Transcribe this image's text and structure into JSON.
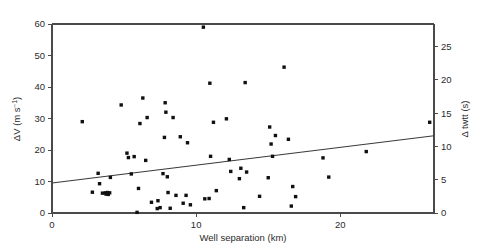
{
  "chart_data": {
    "type": "scatter",
    "title": "",
    "xlabel": "Well separation (km)",
    "ylabel": "ΔV (m s⁻¹)",
    "ylabel_base": "ΔV (m s",
    "ylabel_exponent": "−1",
    "ylabel_close": ")",
    "y2label": "Δ twtt (s)",
    "xlim": [
      0,
      26.5
    ],
    "ylim": [
      0,
      60
    ],
    "y2lim": [
      0,
      28.4
    ],
    "grid": false,
    "legend": null,
    "xticks": [
      0,
      10,
      20
    ],
    "xtick_labels": [
      "0",
      "10",
      "20"
    ],
    "yticks": [
      0,
      10,
      20,
      30,
      40,
      50,
      60
    ],
    "ytick_labels": [
      "0",
      "10",
      "20",
      "30",
      "40",
      "50",
      "60"
    ],
    "y2ticks": [
      0,
      5,
      10,
      15,
      20,
      25
    ],
    "y2tick_labels": [
      "0",
      "5",
      "10",
      "15",
      "20",
      "25"
    ],
    "marker": "square",
    "marker_color": "#101010",
    "marker_size": 3.4,
    "line_color": "#3a3a3a",
    "trend_line": {
      "x0": 0,
      "y0": 9.5,
      "x1": 26.5,
      "y1": 24.5,
      "label": "linear trend"
    },
    "points": [
      [
        2.1,
        29.0
      ],
      [
        2.8,
        6.6
      ],
      [
        3.2,
        12.6
      ],
      [
        3.3,
        9.3
      ],
      [
        3.5,
        6.3
      ],
      [
        3.7,
        6.4
      ],
      [
        3.75,
        6.0
      ],
      [
        3.85,
        6.5
      ],
      [
        3.9,
        5.9
      ],
      [
        4.0,
        6.4
      ],
      [
        4.05,
        11.3
      ],
      [
        4.8,
        34.3
      ],
      [
        5.2,
        19.0
      ],
      [
        5.3,
        17.6
      ],
      [
        5.5,
        12.4
      ],
      [
        5.7,
        17.9
      ],
      [
        5.9,
        0.2
      ],
      [
        6.0,
        7.8
      ],
      [
        6.1,
        28.4
      ],
      [
        6.3,
        36.5
      ],
      [
        6.5,
        16.7
      ],
      [
        6.6,
        30.3
      ],
      [
        6.9,
        3.4
      ],
      [
        7.3,
        1.4
      ],
      [
        7.35,
        3.9
      ],
      [
        7.5,
        1.7
      ],
      [
        7.7,
        12.5
      ],
      [
        7.8,
        24.0
      ],
      [
        7.85,
        35.0
      ],
      [
        7.9,
        32.0
      ],
      [
        8.0,
        11.5
      ],
      [
        8.05,
        6.5
      ],
      [
        8.2,
        1.5
      ],
      [
        8.4,
        30.3
      ],
      [
        8.6,
        5.6
      ],
      [
        8.9,
        24.2
      ],
      [
        9.1,
        3.1
      ],
      [
        9.3,
        5.6
      ],
      [
        9.4,
        22.3
      ],
      [
        9.6,
        2.6
      ],
      [
        10.5,
        59.0
      ],
      [
        10.6,
        4.5
      ],
      [
        10.9,
        4.6
      ],
      [
        10.95,
        41.2
      ],
      [
        11.0,
        18.0
      ],
      [
        11.2,
        28.8
      ],
      [
        11.4,
        7.1
      ],
      [
        12.1,
        29.9
      ],
      [
        12.3,
        17.0
      ],
      [
        12.4,
        13.2
      ],
      [
        13.0,
        10.9
      ],
      [
        13.1,
        14.2
      ],
      [
        13.3,
        1.7
      ],
      [
        13.4,
        41.4
      ],
      [
        13.5,
        13.0
      ],
      [
        14.4,
        5.3
      ],
      [
        15.0,
        11.2
      ],
      [
        15.1,
        27.3
      ],
      [
        15.2,
        21.9
      ],
      [
        15.3,
        18.0
      ],
      [
        15.5,
        24.6
      ],
      [
        16.1,
        46.3
      ],
      [
        16.4,
        23.4
      ],
      [
        16.6,
        2.2
      ],
      [
        16.7,
        8.4
      ],
      [
        16.9,
        5.2
      ],
      [
        18.8,
        17.5
      ],
      [
        19.2,
        11.4
      ],
      [
        21.8,
        19.5
      ],
      [
        26.2,
        28.8
      ]
    ]
  },
  "figure": {
    "background_color": "#ffffff",
    "frame_color": "#4a4a4a"
  }
}
